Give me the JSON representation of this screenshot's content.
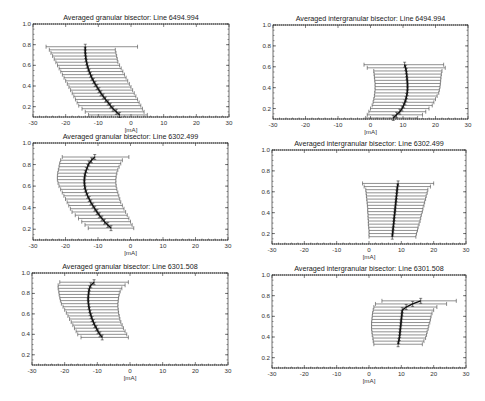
{
  "figure": {
    "layout": "3x2 grid of bisector plots",
    "colors": {
      "axis": "#333333",
      "bars": "#444444",
      "bisector": "#111111",
      "background": "#ffffff"
    }
  },
  "chart_data": [
    {
      "type": "line",
      "panel": "top-left",
      "title": "Averaged granular bisector: Line 6494.994",
      "xlabel": "[mA]",
      "ylabel": "",
      "xlim": [
        -30,
        30
      ],
      "ylim": [
        0.1,
        1.0
      ],
      "xticks": [
        "-30",
        "-20",
        "-10",
        "0",
        "10",
        "20",
        "30"
      ],
      "yticks": [
        "0.2",
        "0.4",
        "0.6",
        "0.8",
        "1.0"
      ],
      "series": [
        {
          "name": "bisector",
          "y": [
            0.12,
            0.15,
            0.18,
            0.21,
            0.24,
            0.27,
            0.3,
            0.33,
            0.36,
            0.39,
            0.42,
            0.45,
            0.48,
            0.51,
            0.54,
            0.57,
            0.6,
            0.63,
            0.66,
            0.69,
            0.72,
            0.75,
            0.78
          ],
          "x": [
            -3.5,
            -4.5,
            -5.5,
            -6.3,
            -7.0,
            -7.8,
            -8.5,
            -9.2,
            -9.8,
            -10.4,
            -11.0,
            -11.5,
            -12.0,
            -12.4,
            -12.8,
            -13.1,
            -13.4,
            -13.6,
            -13.8,
            -13.9,
            -14.0,
            -14.0,
            -14.0
          ],
          "x_err_low": [
            -13,
            -14,
            -15,
            -16,
            -16.5,
            -17,
            -17.5,
            -18,
            -18.5,
            -19,
            -19.5,
            -20,
            -20.5,
            -21,
            -21.5,
            -22,
            -22.5,
            -23,
            -23.5,
            -24,
            -24.5,
            -25,
            -26
          ],
          "x_err_high": [
            5,
            4,
            3.5,
            3,
            2.5,
            2,
            1.5,
            1,
            0.5,
            0,
            -0.5,
            -1,
            -1.5,
            -2,
            -2.5,
            -3,
            -3.5,
            -4,
            -4.2,
            -4.4,
            -4.6,
            -4.8,
            2
          ]
        }
      ]
    },
    {
      "type": "line",
      "panel": "top-right",
      "title": "Averaged intergranular bisector: Line 6494.994",
      "xlabel": "[mA]",
      "ylabel": "",
      "xlim": [
        -30,
        30
      ],
      "ylim": [
        0.1,
        1.0
      ],
      "xticks": [
        "-30",
        "-20",
        "-10",
        "0",
        "10",
        "20",
        "30"
      ],
      "yticks": [
        "0.2",
        "0.4",
        "0.6",
        "0.8",
        "1.0"
      ],
      "series": [
        {
          "name": "bisector",
          "y": [
            0.11,
            0.14,
            0.17,
            0.2,
            0.23,
            0.26,
            0.29,
            0.32,
            0.35,
            0.38,
            0.41,
            0.44,
            0.47,
            0.5,
            0.53,
            0.56,
            0.59,
            0.62
          ],
          "x": [
            7.0,
            8.0,
            9.0,
            9.7,
            10.2,
            10.6,
            10.9,
            11.1,
            11.3,
            11.4,
            11.4,
            11.4,
            11.3,
            11.2,
            11.1,
            11.0,
            10.8,
            10.5
          ],
          "x_err_low": [
            -1.5,
            -1,
            -0.5,
            0,
            0.5,
            0.8,
            1,
            1.2,
            1.3,
            1.4,
            1.4,
            1.4,
            1.3,
            1.2,
            1.1,
            1,
            -1,
            -2
          ],
          "x_err_high": [
            14.5,
            16,
            17,
            18,
            19,
            19.5,
            20,
            20.5,
            21,
            21.2,
            21.4,
            21.5,
            21.6,
            21.7,
            21.8,
            22,
            23,
            22.5
          ]
        }
      ]
    },
    {
      "type": "line",
      "panel": "middle-left",
      "title": "Averaged granular bisector: Line 6302.499",
      "xlabel": "[mA]",
      "ylabel": "",
      "xlim": [
        -30,
        30
      ],
      "ylim": [
        0.1,
        1.0
      ],
      "xticks": [
        "-30",
        "-20",
        "-10",
        "0",
        "10",
        "20",
        "30"
      ],
      "yticks": [
        "0.2",
        "0.4",
        "0.6",
        "0.8",
        "1.0"
      ],
      "series": [
        {
          "name": "bisector",
          "y": [
            0.21,
            0.24,
            0.27,
            0.3,
            0.33,
            0.36,
            0.39,
            0.42,
            0.45,
            0.48,
            0.51,
            0.54,
            0.57,
            0.6,
            0.63,
            0.66,
            0.69,
            0.72,
            0.75,
            0.78,
            0.81,
            0.84,
            0.87
          ],
          "x": [
            -6.0,
            -7.0,
            -8.0,
            -8.8,
            -9.6,
            -10.3,
            -11.0,
            -11.6,
            -12.2,
            -12.7,
            -13.2,
            -13.6,
            -13.9,
            -14.1,
            -14.2,
            -14.2,
            -14.1,
            -13.9,
            -13.6,
            -13.2,
            -12.8,
            -12.0,
            -11.0
          ],
          "x_err_low": [
            -13,
            -14,
            -15,
            -16,
            -17,
            -18,
            -18.5,
            -19,
            -19.5,
            -20,
            -20.5,
            -21,
            -21.5,
            -22,
            -22.3,
            -22.5,
            -22.5,
            -22.4,
            -22.2,
            -22,
            -21.8,
            -21.5,
            -21
          ],
          "x_err_high": [
            1,
            0.5,
            0,
            -0.5,
            -1,
            -1.5,
            -2,
            -2.5,
            -3,
            -3.3,
            -3.6,
            -3.9,
            -4.2,
            -4.4,
            -4.5,
            -4.5,
            -4.4,
            -4.2,
            -3.9,
            -3.5,
            -3,
            -2.5,
            -0.5
          ]
        }
      ]
    },
    {
      "type": "line",
      "panel": "middle-right",
      "title": "Averaged intergranular bisector: Line 6302.499",
      "xlabel": "[mA]",
      "ylabel": "",
      "xlim": [
        -30,
        30
      ],
      "ylim": [
        0.1,
        1.0
      ],
      "xticks": [
        "-30",
        "-20",
        "-10",
        "0",
        "10",
        "20",
        "30"
      ],
      "yticks": [
        "0.2",
        "0.4",
        "0.6",
        "0.8",
        "1.0"
      ],
      "series": [
        {
          "name": "bisector",
          "y": [
            0.17,
            0.2,
            0.23,
            0.26,
            0.29,
            0.32,
            0.35,
            0.38,
            0.41,
            0.44,
            0.47,
            0.5,
            0.53,
            0.56,
            0.59,
            0.62,
            0.65,
            0.68
          ],
          "x": [
            7.2,
            7.3,
            7.4,
            7.5,
            7.6,
            7.7,
            7.8,
            7.9,
            8.0,
            8.1,
            8.2,
            8.3,
            8.4,
            8.5,
            8.6,
            8.7,
            8.8,
            9.0
          ],
          "x_err_low": [
            0,
            0,
            0,
            -0.1,
            -0.2,
            -0.2,
            -0.3,
            -0.3,
            -0.4,
            -0.4,
            -0.5,
            -0.6,
            -0.7,
            -0.8,
            -0.9,
            -1,
            -1.5,
            -2
          ],
          "x_err_high": [
            14.5,
            14.7,
            15,
            15.2,
            15.5,
            15.8,
            16,
            16.2,
            16.5,
            16.7,
            17,
            17.2,
            17.5,
            17.7,
            18,
            18.2,
            19,
            20
          ]
        }
      ]
    },
    {
      "type": "line",
      "panel": "bottom-left",
      "title": "Averaged granular bisector: Line 6301.508",
      "xlabel": "[mA]",
      "ylabel": "",
      "xlim": [
        -30,
        30
      ],
      "ylim": [
        0.1,
        1.0
      ],
      "xticks": [
        "-30",
        "-20",
        "-10",
        "0",
        "10",
        "20",
        "30"
      ],
      "yticks": [
        "0.2",
        "0.4",
        "0.6",
        "0.8",
        "1.0"
      ],
      "series": [
        {
          "name": "bisector",
          "y": [
            0.37,
            0.4,
            0.43,
            0.46,
            0.49,
            0.52,
            0.55,
            0.58,
            0.61,
            0.64,
            0.67,
            0.7,
            0.73,
            0.76,
            0.79,
            0.82,
            0.85,
            0.88,
            0.91
          ],
          "x": [
            -8.5,
            -9.2,
            -9.8,
            -10.3,
            -10.8,
            -11.2,
            -11.6,
            -11.9,
            -12.2,
            -12.4,
            -12.6,
            -12.7,
            -12.8,
            -12.8,
            -12.7,
            -12.6,
            -12.4,
            -12.0,
            -11.0
          ],
          "x_err_low": [
            -15,
            -16,
            -16.5,
            -17,
            -17.5,
            -18,
            -18.5,
            -19,
            -19.5,
            -20,
            -20.5,
            -21,
            -21.3,
            -21.5,
            -21.7,
            -21.8,
            -22,
            -22,
            -21.5
          ],
          "x_err_high": [
            -0.5,
            -1,
            -1.5,
            -2,
            -2.4,
            -2.8,
            -3.1,
            -3.3,
            -3.5,
            -3.6,
            -3.7,
            -3.7,
            -3.6,
            -3.5,
            -3.3,
            -3,
            -2.5,
            -1.5,
            -0.5
          ]
        }
      ]
    },
    {
      "type": "line",
      "panel": "bottom-right",
      "title": "Averaged intergranular bisector: Line 6301.508",
      "xlabel": "[mA]",
      "ylabel": "",
      "xlim": [
        -30,
        30
      ],
      "ylim": [
        0.1,
        1.0
      ],
      "xticks": [
        "-30",
        "-20",
        "-10",
        "0",
        "10",
        "20",
        "30"
      ],
      "yticks": [
        "0.2",
        "0.4",
        "0.6",
        "0.8",
        "1.0"
      ],
      "series": [
        {
          "name": "bisector",
          "y": [
            0.33,
            0.36,
            0.39,
            0.42,
            0.45,
            0.48,
            0.51,
            0.54,
            0.57,
            0.6,
            0.63,
            0.66,
            0.69,
            0.72,
            0.75
          ],
          "x": [
            9.0,
            9.2,
            9.4,
            9.5,
            9.6,
            9.7,
            9.8,
            9.9,
            10.0,
            10.1,
            10.2,
            10.3,
            11.5,
            13.5,
            16.0
          ],
          "x_err_low": [
            1.5,
            1.3,
            1.2,
            1,
            0.9,
            0.8,
            0.8,
            0.8,
            0.9,
            1,
            1.1,
            1.3,
            1.5,
            2,
            4
          ],
          "x_err_high": [
            16.5,
            17,
            17.5,
            17.8,
            18,
            18.3,
            18.5,
            18.8,
            19,
            19.2,
            19.5,
            20,
            21,
            24,
            27
          ]
        }
      ]
    }
  ]
}
